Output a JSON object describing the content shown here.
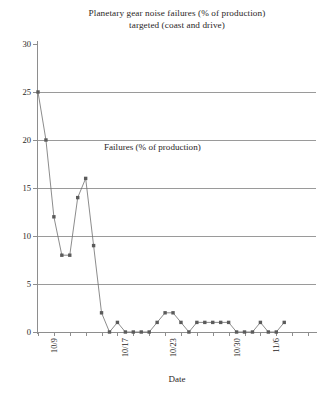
{
  "chart_data": {
    "type": "line",
    "title": "Planetary gear noise failures (% of production) targeted (coast and drive)",
    "title_line1": "Planetary gear noise failures (% of production)",
    "title_line2": "targeted (coast and drive)",
    "xlabel": "Date",
    "ylabel": "",
    "series_annotation": "Failures (% of production)",
    "legend_position": "inline-annotation",
    "grid": true,
    "ylim": [
      0,
      30
    ],
    "yticks": [
      0,
      5,
      10,
      15,
      20,
      25,
      30
    ],
    "ytick_labels": [
      "0",
      "5",
      "10",
      "15",
      "20",
      "25",
      "30"
    ],
    "xtick_labels": [
      "10/9",
      "10/17",
      "10/23",
      "10/30",
      "11/6"
    ],
    "xtick_indices": [
      1,
      10,
      16,
      24,
      29
    ],
    "x_count": 36,
    "series": [
      {
        "name": "Failures (% of production)",
        "color": "#5b5b5b",
        "values": [
          25,
          20,
          12,
          8,
          8,
          14,
          16,
          9,
          2,
          0,
          1,
          0,
          0,
          0,
          0,
          1,
          2,
          2,
          1,
          0,
          1,
          1,
          1,
          1,
          1,
          0,
          0,
          0,
          1,
          0,
          0,
          1
        ]
      }
    ]
  },
  "colors": {
    "line": "#6f6f6f",
    "marker": "#5b5b5b",
    "grid": "#9a9a9a",
    "axis": "#8e8e8e",
    "text": "#2a2626",
    "background": "#ffffff"
  }
}
